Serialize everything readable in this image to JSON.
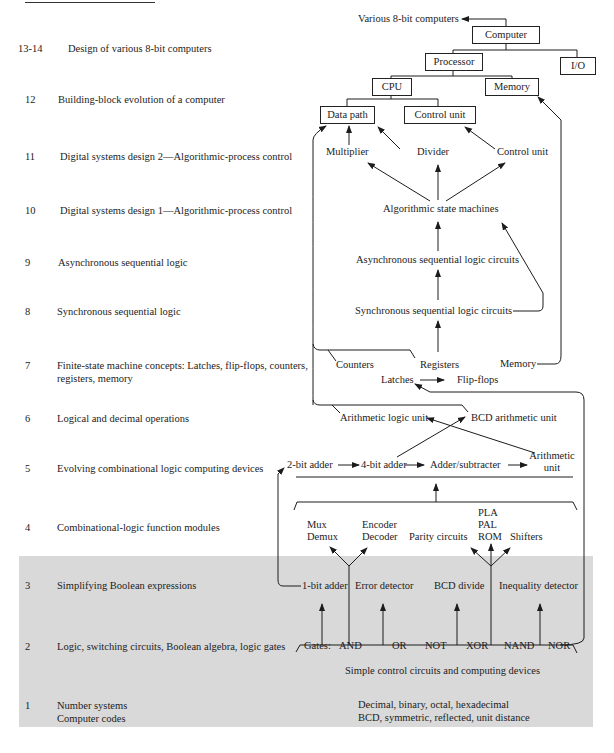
{
  "chapters": [
    {
      "num": "13-14",
      "title": "Design of various 8-bit computers",
      "top": 42
    },
    {
      "num": "12",
      "title": "Building-block evolution of a computer",
      "top": 93
    },
    {
      "num": "11",
      "title": "Digital systems design 2—Algorithmic-process control",
      "top": 150
    },
    {
      "num": "10",
      "title": "Digital systems design 1—Algorithmic-process control",
      "top": 204
    },
    {
      "num": "9",
      "title": "Asynchronous sequential logic",
      "top": 256
    },
    {
      "num": "8",
      "title": "Synchronous sequential logic",
      "top": 305
    },
    {
      "num": "7",
      "title": "Finite-state machine concepts: Latches, flip-flops, counters,",
      "title2": "registers, memory",
      "top": 359
    },
    {
      "num": "6",
      "title": "Logical and decimal operations",
      "top": 412
    },
    {
      "num": "5",
      "title": "Evolving combinational logic computing devices",
      "top": 462
    },
    {
      "num": "4",
      "title": "Combinational-logic function modules",
      "top": 521
    },
    {
      "num": "3",
      "title": "Simplifying Boolean expressions",
      "top": 579
    },
    {
      "num": "2",
      "title": "Logic, switching circuits, Boolean algebra, logic gates",
      "top": 640
    },
    {
      "num": "1",
      "title": "Number systems",
      "title2": "Computer codes",
      "top": 699
    }
  ],
  "diagram": {
    "various_8bit": "Various 8-bit computers",
    "boxes": {
      "computer": "Computer",
      "processor": "Processor",
      "io": "I/O",
      "cpu": "CPU",
      "memory": "Memory",
      "data_path": "Data path",
      "control_unit": "Control unit"
    },
    "level11": {
      "multiplier": "Multiplier",
      "divider": "Divider",
      "control_unit": "Control unit"
    },
    "level10": {
      "asm": "Algorithmic state machines"
    },
    "level9": {
      "async": "Asynchronous sequential logic circuits"
    },
    "level8": {
      "sync": "Synchronous sequential logic circuits"
    },
    "level7": {
      "counters": "Counters",
      "registers": "Registers",
      "memory": "Memory",
      "latches": "Latches",
      "flipflops": "Flip-flops"
    },
    "level6": {
      "alu": "Arithmetic logic unit",
      "bcd_au": "BCD arithmetic unit"
    },
    "level5": {
      "adder2": "2-bit adder",
      "adder4": "4-bit adder",
      "addsub": "Adder/subtracter",
      "au1": "Arithmetic",
      "au2": "unit"
    },
    "level4": {
      "mux": "Mux",
      "demux": "Demux",
      "encoder": "Encoder",
      "decoder": "Decoder",
      "parity": "Parity circuits",
      "pla": "PLA",
      "pal": "PAL",
      "rom": "ROM",
      "shifters": "Shifters"
    },
    "level3": {
      "adder1": "1-bit adder",
      "error": "Error detector",
      "bcd_divide": "BCD divide",
      "inequality": "Inequality detector"
    },
    "level2": {
      "gates_label": "Gates:",
      "gates": [
        "AND",
        "OR",
        "NOT",
        "XOR",
        "NAND",
        "NOR"
      ],
      "simple": "Simple control circuits and computing devices"
    },
    "level1": {
      "numbers": "Decimal, binary, octal, hexadecimal",
      "codes": "BCD, symmetric, reflected, unit distance"
    }
  },
  "colors": {
    "shade": "#d9d9d9",
    "ink": "#1c1c1c"
  }
}
